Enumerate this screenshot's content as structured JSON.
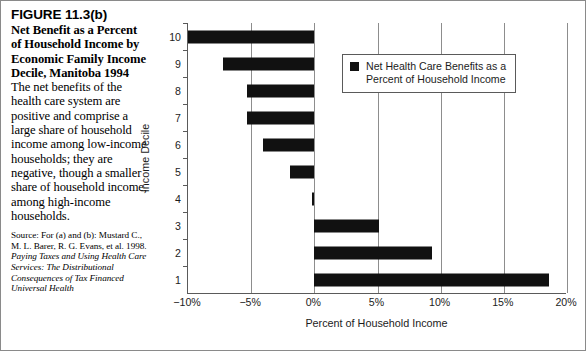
{
  "caption": {
    "figure_number": "FIGURE 11.3(b)",
    "title": "Net Benefit as a Percent of Household Income by Economic Family Income Decile, Manitoba 1994",
    "body": "The net benefits of the health care system are positive and comprise a large share of household income among low-income households; they are negative, though a smaller share of household income, among high-income households.",
    "source_prefix": "Source: For (a) and (b): Mustard C., M. L. Barer, R. G. Evans, et al. 1998. ",
    "source_italic": "Paying Taxes and Using Health Care Services: The Distributional Consequences of Tax Financed Universal Health"
  },
  "legend": {
    "label": "Net Health Care Benefits as a\nPercent of Household Income",
    "swatch_color": "#111111"
  },
  "chart_data": {
    "type": "bar",
    "orientation": "horizontal",
    "title": "",
    "xlabel": "Percent of Household Income",
    "ylabel": "Income Decile",
    "categories": [
      "1",
      "2",
      "3",
      "4",
      "5",
      "6",
      "7",
      "8",
      "9",
      "10"
    ],
    "series": [
      {
        "name": "Net Health Care Benefits as a Percent of Household Income",
        "values": [
          18.6,
          9.3,
          5.1,
          -0.2,
          -1.9,
          -4.1,
          -5.3,
          -5.3,
          -7.2,
          -10.0
        ],
        "color": "#111111"
      }
    ],
    "xlim": [
      -10,
      20
    ],
    "xticks": [
      -10,
      -5,
      0,
      5,
      10,
      15,
      20
    ],
    "xticklabels": [
      "−10%",
      "−5%",
      "0%",
      "5%",
      "10%",
      "15%",
      "20%"
    ],
    "yticklabels": [
      "1",
      "2",
      "3",
      "4",
      "5",
      "6",
      "7",
      "8",
      "9",
      "10"
    ],
    "grid": "vertical",
    "legend_position": "upper right"
  }
}
